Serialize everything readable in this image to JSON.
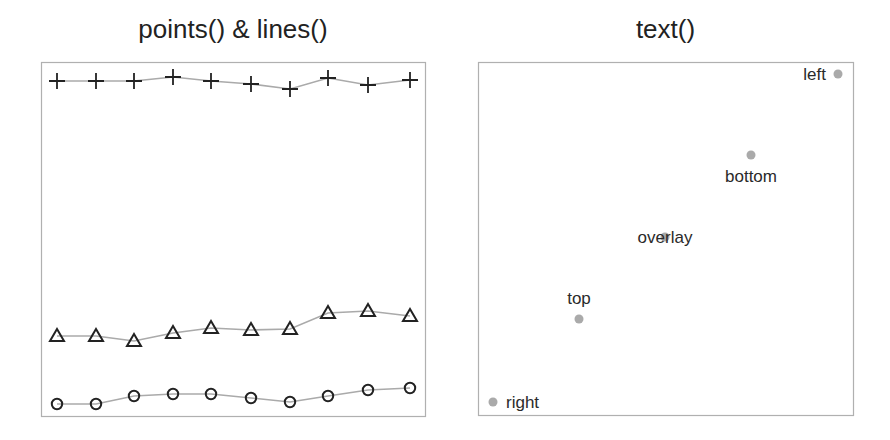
{
  "chart_data": [
    {
      "type": "line",
      "title": "points() & lines()",
      "xlabel": "",
      "ylabel": "",
      "axes": false,
      "grid": false,
      "legend": null,
      "x": [
        1,
        2,
        3,
        4,
        5,
        6,
        7,
        8,
        9,
        10
      ],
      "series": [
        {
          "name": "plus",
          "marker": "+",
          "pixel_y": [
            81,
            81,
            81,
            77,
            81,
            84,
            89,
            78,
            85,
            80
          ]
        },
        {
          "name": "triangle",
          "marker": "triangle-open",
          "pixel_y": [
            336,
            336,
            341,
            333,
            328,
            330,
            329,
            313,
            311,
            316
          ]
        },
        {
          "name": "circle",
          "marker": "circle-open",
          "pixel_y": [
            404,
            404,
            396,
            394,
            394,
            398,
            402,
            396,
            390,
            388
          ]
        }
      ],
      "pixel_x": [
        57,
        96,
        134,
        173,
        211,
        251,
        290,
        328,
        368,
        410
      ],
      "line_color": "#aaaaaa",
      "marker_color": "#222222"
    },
    {
      "type": "scatter",
      "title": "text()",
      "axes": false,
      "grid": false,
      "point_color": "#aaaaaa",
      "points": [
        {
          "label": "left",
          "pos": "left",
          "px": 838,
          "py": 74
        },
        {
          "label": "bottom",
          "pos": "bottom",
          "px": 751,
          "py": 155
        },
        {
          "label": "overlay",
          "pos": "center",
          "px": 665,
          "py": 237
        },
        {
          "label": "top",
          "pos": "top",
          "px": 579,
          "py": 319
        },
        {
          "label": "right",
          "pos": "right",
          "px": 493,
          "py": 402
        }
      ]
    }
  ],
  "panels": {
    "left_title": "points() & lines()",
    "right_title": "text()",
    "labels": {
      "left": "left",
      "bottom": "bottom",
      "overlay": "overlay",
      "top": "top",
      "right": "right"
    }
  }
}
